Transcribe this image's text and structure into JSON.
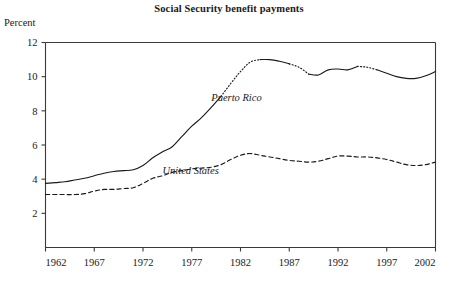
{
  "chart_data": {
    "type": "line",
    "title": "Social Security benefit payments",
    "ylabel": "Percent",
    "xlabel": "",
    "xlim": [
      1962,
      2002
    ],
    "ylim": [
      0,
      12
    ],
    "yticks": [
      2,
      4,
      6,
      8,
      10,
      12
    ],
    "xticks": [
      1962,
      1967,
      1972,
      1977,
      1982,
      1987,
      1992,
      1997,
      2002
    ],
    "grid": false,
    "legend_position": "inline-annotations",
    "annotations": [
      {
        "text": "Puerto Rico",
        "x": 1979,
        "y": 8.6
      },
      {
        "text": "United States",
        "x": 1974,
        "y": 4.3
      }
    ],
    "series": [
      {
        "name": "Puerto Rico",
        "style": "solid-with-dotted-gaps",
        "x": [
          1962,
          1963,
          1964,
          1965,
          1966,
          1967,
          1968,
          1969,
          1970,
          1971,
          1972,
          1973,
          1974,
          1975,
          1976,
          1977,
          1978,
          1979,
          1980,
          1981,
          1982,
          1983,
          1984,
          1985,
          1986,
          1987,
          1988,
          1989,
          1990,
          1991,
          1992,
          1993,
          1994,
          1995,
          1996,
          1997,
          1998,
          1999,
          2000,
          2001,
          2002
        ],
        "values": [
          3.75,
          3.8,
          3.85,
          3.95,
          4.05,
          4.2,
          4.35,
          4.45,
          4.5,
          4.55,
          4.8,
          5.25,
          5.6,
          5.9,
          6.5,
          7.1,
          7.6,
          8.2,
          8.85,
          9.6,
          10.3,
          10.85,
          11.0,
          11.0,
          10.9,
          10.75,
          10.55,
          10.15,
          10.1,
          10.4,
          10.45,
          10.4,
          10.6,
          10.55,
          10.4,
          10.2,
          10.0,
          9.9,
          9.9,
          10.05,
          10.3
        ],
        "dotted_segments": [
          [
            1980,
            1984
          ],
          [
            1987,
            1989
          ],
          [
            1994,
            1996
          ]
        ]
      },
      {
        "name": "United States",
        "style": "dashed",
        "x": [
          1962,
          1963,
          1964,
          1965,
          1966,
          1967,
          1968,
          1969,
          1970,
          1971,
          1972,
          1973,
          1974,
          1975,
          1976,
          1977,
          1978,
          1979,
          1980,
          1981,
          1982,
          1983,
          1984,
          1985,
          1986,
          1987,
          1988,
          1989,
          1990,
          1991,
          1992,
          1993,
          1994,
          1995,
          1996,
          1997,
          1998,
          1999,
          2000,
          2001,
          2002
        ],
        "values": [
          3.1,
          3.1,
          3.1,
          3.1,
          3.15,
          3.3,
          3.4,
          3.4,
          3.45,
          3.5,
          3.75,
          4.05,
          4.2,
          4.4,
          4.5,
          4.6,
          4.65,
          4.7,
          4.85,
          5.15,
          5.4,
          5.5,
          5.4,
          5.3,
          5.2,
          5.1,
          5.05,
          5.0,
          5.05,
          5.2,
          5.35,
          5.35,
          5.3,
          5.3,
          5.25,
          5.15,
          5.0,
          4.85,
          4.8,
          4.85,
          5.0
        ]
      }
    ]
  }
}
